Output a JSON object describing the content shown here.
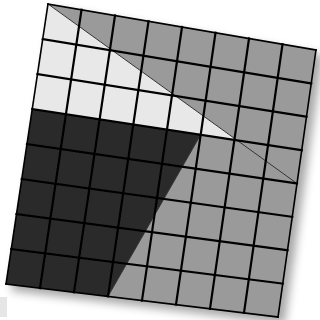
{
  "diagram": {
    "type": "rotated-grid-square",
    "grid_size": 8,
    "corners_px": {
      "top_left": [
        48,
        4
      ],
      "top_right": [
        316,
        50
      ],
      "bottom_right": [
        278,
        317
      ],
      "bottom_left": [
        6,
        284
      ]
    },
    "regions": [
      {
        "name": "top-right-triangle",
        "color": "#9a9a9a",
        "points": [
          [
            0,
            0
          ],
          [
            8,
            0
          ],
          [
            8,
            4
          ]
        ]
      },
      {
        "name": "light-band",
        "color": "#e8e8e8",
        "points": [
          [
            0,
            0
          ],
          [
            8,
            4
          ],
          [
            8,
            3
          ],
          [
            0,
            3
          ]
        ]
      },
      {
        "name": "dark-region",
        "color": "#2b2b2b",
        "points": [
          [
            0,
            3
          ],
          [
            5,
            3
          ],
          [
            3,
            8
          ],
          [
            0,
            8
          ]
        ]
      },
      {
        "name": "bottom-right-region",
        "color": "#9a9a9a",
        "points": [
          [
            5,
            3
          ],
          [
            8,
            3
          ],
          [
            8,
            8
          ],
          [
            3,
            8
          ]
        ]
      }
    ],
    "line_color": "#000000",
    "shadow": true
  }
}
